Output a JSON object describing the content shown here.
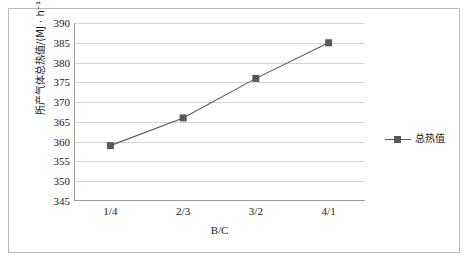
{
  "chart_data": {
    "type": "line",
    "title": "",
    "subtitle": "",
    "xlabel": "B/C",
    "ylabel": "所产气体总热值/(MJ · h⁻¹)",
    "categories": [
      "1/4",
      "2/3",
      "3/2",
      "4/1"
    ],
    "series": [
      {
        "name": "总热值",
        "values": [
          359,
          366,
          376,
          385
        ],
        "color": "#595959",
        "marker": "square",
        "line_color": "#5a5a5a"
      }
    ],
    "ylim": [
      345,
      390
    ],
    "ytick_values": [
      390,
      385,
      380,
      375,
      370,
      365,
      360,
      355,
      350,
      345
    ],
    "ytick_labels": [
      "390",
      "385",
      "380",
      "375",
      "370",
      "365",
      "360",
      "355",
      "350",
      "345"
    ],
    "ystep": 5,
    "grid": "horizontal",
    "legend_position": "right",
    "legend_entries": [
      "总热值"
    ],
    "annotations": [],
    "frame": true
  },
  "colors": {
    "series": "#595959",
    "gridline": "#d4d4d4",
    "axis": "#9a9a9a",
    "frame": "#b9b9b9",
    "text": "#1a1a1a",
    "background": "#ffffff"
  }
}
